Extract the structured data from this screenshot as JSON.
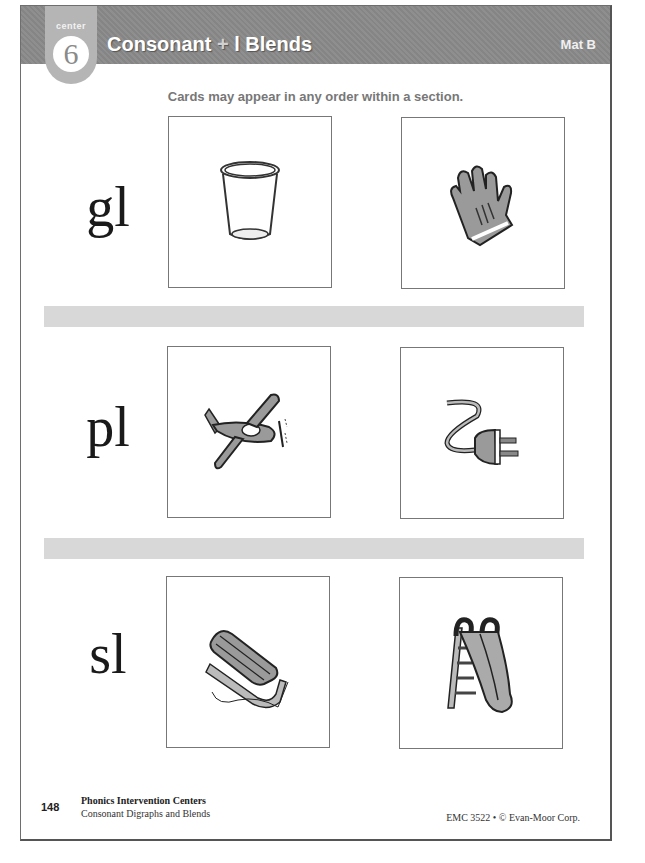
{
  "header": {
    "badge_label": "center",
    "badge_number": "6",
    "title_part1": "Consonant",
    "title_plus": "+",
    "title_part2": "l Blends",
    "mat": "Mat B"
  },
  "instructions": "Cards may appear in any order within a section.",
  "sections": [
    {
      "blend": "gl",
      "cards": [
        {
          "picture": "glass"
        },
        {
          "picture": "glove"
        }
      ]
    },
    {
      "blend": "pl",
      "cards": [
        {
          "picture": "plane"
        },
        {
          "picture": "plug"
        }
      ]
    },
    {
      "blend": "sl",
      "cards": [
        {
          "picture": "sled"
        },
        {
          "picture": "slide"
        }
      ]
    }
  ],
  "footer": {
    "page_number": "148",
    "book_title": "Phonics Intervention Centers",
    "book_subtitle": "Consonant Digraphs and Blends",
    "copyright": "EMC 3522 • © Evan-Moor Corp."
  },
  "colors": {
    "header_bg": "#8a8a8a",
    "badge_bg": "#b5b5b5",
    "band_bg": "#d8d8d8",
    "illustration_fill": "#999999"
  }
}
